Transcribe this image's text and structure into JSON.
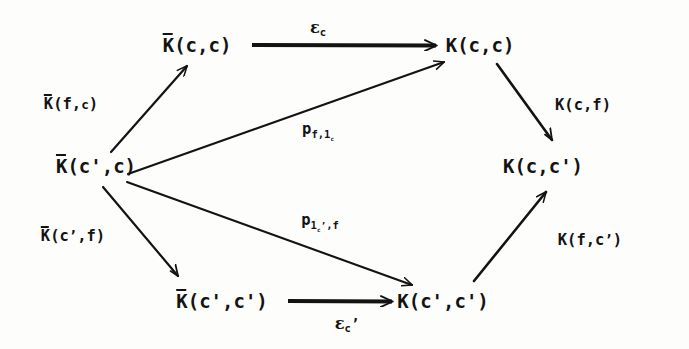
{
  "diagram": {
    "type": "commutative-diagram",
    "ink_color": "#131313",
    "background_color": "#fdfdfc",
    "nodes": [
      {
        "id": "kbar-c-c",
        "label": "K̅(c,c)",
        "plain": "Kbar(c,c)",
        "x": 197,
        "y": 45,
        "overline": true,
        "args": "(c,c)"
      },
      {
        "id": "k-c-c",
        "label": "K(c,c)",
        "plain": "K(c,c)",
        "x": 480,
        "y": 45,
        "overline": false,
        "args": "(c,c)"
      },
      {
        "id": "kbar-cp-c",
        "label": "K̅(c',c)",
        "plain": "Kbar(c',c)",
        "x": 96,
        "y": 166,
        "overline": true,
        "args": "(c',c)"
      },
      {
        "id": "k-c-cp",
        "label": "K(c,c')",
        "plain": "K(c,c')",
        "x": 543,
        "y": 166,
        "overline": false,
        "args": "(c,c')"
      },
      {
        "id": "kbar-cp-cp",
        "label": "K̅(c',c')",
        "plain": "Kbar(c',c')",
        "x": 222,
        "y": 301,
        "overline": true,
        "args": "(c',c')"
      },
      {
        "id": "k-cp-cp",
        "label": "K(c',c')",
        "plain": "K(c',c')",
        "x": 443,
        "y": 301,
        "overline": false,
        "args": "(c',c')"
      }
    ],
    "edges": [
      {
        "id": "edge-epsilon-c",
        "from": "kbar-c-c",
        "to": "k-c-c",
        "label": "ε_c",
        "plain": "epsilon_c",
        "label_x": 318,
        "label_y": 28,
        "style": "solid",
        "kind": "horizontal"
      },
      {
        "id": "edge-kbar-f-c",
        "from": "kbar-cp-c",
        "to": "kbar-c-c",
        "label": "K̅(f,c)",
        "plain": "Kbar(f,c)",
        "label_x": 71,
        "label_y": 104,
        "style": "solid",
        "kind": "diagonal-up-right"
      },
      {
        "id": "edge-p-f-1c",
        "from": "kbar-cp-c",
        "to": "k-c-c",
        "label": "p_{f,1_c}",
        "plain": "p_f,1_c",
        "label_x": 318,
        "label_y": 131,
        "style": "solid",
        "kind": "long-diagonal-up-right"
      },
      {
        "id": "edge-k-c-f",
        "from": "k-c-c",
        "to": "k-c-cp",
        "label": "K(c,f)",
        "plain": "K(c,f)",
        "label_x": 583,
        "label_y": 105,
        "style": "solid",
        "kind": "diagonal-down-right"
      },
      {
        "id": "edge-kbar-cp-f",
        "from": "kbar-cp-c",
        "to": "kbar-cp-cp",
        "label": "K̅(c',f)",
        "plain": "Kbar(c',f)",
        "label_x": 73,
        "label_y": 236,
        "style": "solid",
        "kind": "diagonal-down-right"
      },
      {
        "id": "edge-p-1cp-f",
        "from": "kbar-cp-c",
        "to": "k-cp-cp",
        "label": "p_{1_c',f}",
        "plain": "p_1_c',f",
        "label_x": 320,
        "label_y": 222,
        "style": "solid",
        "kind": "long-diagonal-down-right"
      },
      {
        "id": "edge-epsilon-cp",
        "from": "kbar-cp-cp",
        "to": "k-cp-cp",
        "label": "ε_c'",
        "plain": "epsilon_c'",
        "label_x": 347,
        "label_y": 324,
        "style": "solid",
        "kind": "horizontal"
      },
      {
        "id": "edge-k-f-cp",
        "from": "k-cp-cp",
        "to": "k-c-cp",
        "label": "K(f,c')",
        "plain": "K(f,c')",
        "label_x": 590,
        "label_y": 240,
        "style": "solid",
        "kind": "diagonal-up-right"
      }
    ]
  }
}
